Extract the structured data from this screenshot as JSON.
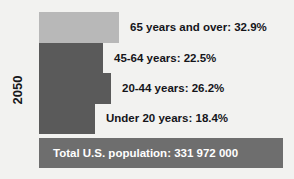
{
  "chart_data": {
    "type": "bar",
    "title": "",
    "orientation": "horizontal",
    "group_label": "2050",
    "categories": [
      "65 years and over",
      "45-64 years",
      "20-44 years",
      "Under 20 years"
    ],
    "values": [
      32.9,
      22.5,
      26.2,
      18.4
    ],
    "value_unit": "%",
    "data_labels": [
      "65 years and over: 32.9%",
      "45-64 years: 22.5%",
      "20-44 years: 26.2%",
      "Under 20 years: 18.4%"
    ],
    "bar_pixel_widths": [
      80,
      64,
      72,
      56
    ],
    "total": {
      "label": "Total U.S. population: 331 972 000",
      "name": "Total U.S. population",
      "value": "331 972 000"
    },
    "xlabel": "",
    "ylabel": "2050",
    "grid": false,
    "legend": "none",
    "colors": {
      "background": "#f2f2f0",
      "bar_light": "#b8b8b8",
      "bar_dark": "#5a5a5a",
      "total_bar": "#6e6e6e",
      "text_dark": "#15151a",
      "text_light": "#ffffff"
    },
    "bars": [
      {
        "label": "65 years and over: 32.9%",
        "category": "65 years and over",
        "value": 32.9,
        "color": "#b8b8b8",
        "width": 80,
        "top": 12
      },
      {
        "label": "45-64 years: 22.5%",
        "category": "45-64 years",
        "value": 22.5,
        "color": "#5a5a5a",
        "width": 64,
        "top": 43
      },
      {
        "label": "20-44 years: 26.2%",
        "category": "20-44 years",
        "value": 26.2,
        "color": "#5a5a5a",
        "width": 72,
        "top": 73
      },
      {
        "label": "Under 20 years: 18.4%",
        "category": "Under 20 years",
        "value": 18.4,
        "color": "#5a5a5a",
        "width": 56,
        "top": 103
      }
    ]
  }
}
